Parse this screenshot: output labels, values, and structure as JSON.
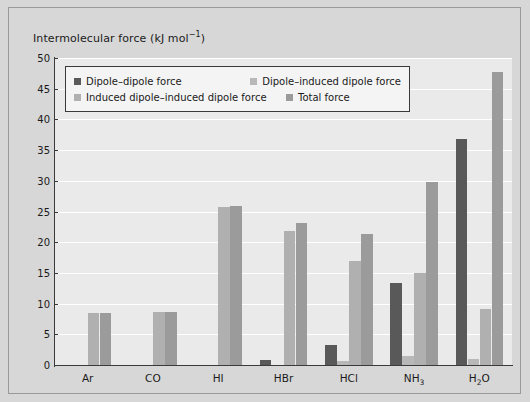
{
  "figure": {
    "axis_title_text": "Intermolecular force (kJ mol",
    "axis_title_sup": "−1",
    "axis_title_close": ")"
  },
  "chart_data": {
    "type": "bar",
    "title": "",
    "subtitle": "",
    "xlabel": "",
    "ylabel": "Intermolecular force (kJ mol⁻¹)",
    "ylim": [
      0,
      50
    ],
    "ytick_values": [
      0,
      5,
      10,
      15,
      20,
      25,
      30,
      35,
      40,
      45,
      50
    ],
    "ytick_labels": [
      "0",
      "5",
      "10",
      "15",
      "20",
      "25",
      "30",
      "35",
      "40",
      "45",
      "50"
    ],
    "grid": true,
    "grid_axis": "y",
    "grid_color": "#ffffff",
    "plot_background": "#eaeaea",
    "figure_background": "#d7d7d7",
    "legend_position": "upper left",
    "categories": [
      "Ar",
      "CO",
      "HI",
      "HBr",
      "HCl",
      "NH3",
      "H2O"
    ],
    "category_labels_html": [
      "Ar",
      "CO",
      "HI",
      "HBr",
      "HCl",
      "NH<sub>3</sub>",
      "H<sub>2</sub>O"
    ],
    "series": [
      {
        "name": "Dipole–dipole force",
        "color": "#595959",
        "values": [
          0,
          0,
          0,
          0.8,
          3.3,
          13.3,
          36.8
        ]
      },
      {
        "name": "Dipole–induced dipole force",
        "color": "#b8b8b8",
        "values": [
          0,
          0,
          0,
          0,
          0.6,
          1.5,
          1.0
        ]
      },
      {
        "name": "Induced dipole–induced dipole force",
        "color": "#b0b0b0",
        "values": [
          8.5,
          8.7,
          25.8,
          21.9,
          17.0,
          15.0,
          9.2
        ]
      },
      {
        "name": "Total force",
        "color": "#9b9b9b",
        "values": [
          8.5,
          8.7,
          25.9,
          23.2,
          21.3,
          29.8,
          47.8
        ]
      }
    ]
  },
  "legend": {
    "items": [
      {
        "label": "Dipole–dipole force",
        "color": "#595959"
      },
      {
        "label": "Dipole–induced dipole force",
        "color": "#b8b8b8"
      },
      {
        "label": "Induced dipole–induced dipole force",
        "color": "#b0b0b0"
      },
      {
        "label": "Total force",
        "color": "#9b9b9b"
      }
    ]
  }
}
